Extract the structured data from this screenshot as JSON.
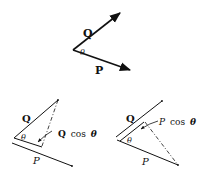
{
  "diagrams": {
    "top": {
      "vector_q": "Q",
      "vector_p": "P",
      "angle": "θ"
    },
    "bottom_left": {
      "vector_q": "Q",
      "vector_p": "P",
      "angle": "θ",
      "projection_label_symbol": "Q",
      "projection_label_func": "cos",
      "projection_label_angle": "θ"
    },
    "bottom_right": {
      "vector_q": "Q",
      "vector_p": "P",
      "angle": "θ",
      "projection_label_symbol": "P",
      "projection_label_func": "cos",
      "projection_label_angle": "θ"
    }
  },
  "colors": {
    "ink": "#111111",
    "background": "#ffffff"
  }
}
